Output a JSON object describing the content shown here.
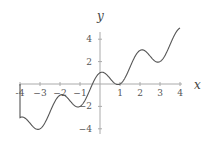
{
  "chart_data": {
    "type": "line",
    "title": "",
    "xlabel": "x",
    "ylabel": "y",
    "xlim": [
      -4,
      4
    ],
    "ylim": [
      -4.5,
      5
    ],
    "grid": false,
    "legend": null,
    "x_ticks": [
      -4,
      -3,
      -2,
      -1,
      1,
      2,
      3,
      4
    ],
    "y_ticks": [
      4,
      2,
      -2,
      -4
    ],
    "x_tick_labels": [
      "-4",
      "−3",
      "−2",
      "−1",
      "1",
      "2",
      "3",
      "4"
    ],
    "y_tick_labels": [
      "4",
      "2",
      "−2",
      "−4"
    ],
    "series": [
      {
        "name": "y = x + cos(πx)",
        "x": [
          -4,
          -3.5,
          -3,
          -2.5,
          -2,
          -1.5,
          -1,
          -0.5,
          0,
          0.5,
          1,
          1.5,
          2,
          2.5,
          3,
          3.5,
          4
        ],
        "values": [
          -3,
          -3.5,
          -4,
          -2.5,
          -1,
          -1.5,
          -2,
          -0.5,
          1,
          0.5,
          0,
          1.5,
          3,
          2.5,
          2,
          3.5,
          5
        ]
      }
    ],
    "annotations": [
      "vertical segment at x = -4 from y = 0 to y = -3"
    ],
    "colors": {
      "curve": "#555555",
      "axes": "#999999"
    }
  },
  "axes": {
    "x_label": "x",
    "y_label": "y"
  }
}
